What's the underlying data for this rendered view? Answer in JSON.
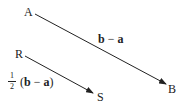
{
  "diagram": {
    "points": {
      "A": "A",
      "B": "B",
      "R": "R",
      "S": "S"
    },
    "vectors": [
      {
        "from": "A",
        "to": "B",
        "label_bold1": "b",
        "label_op": " − ",
        "label_bold2": "a"
      },
      {
        "from": "R",
        "to": "S",
        "fraction_num": "1",
        "fraction_den": "2",
        "label_open": "(",
        "label_bold1": "b",
        "label_op": " − ",
        "label_bold2": "a",
        "label_close": ")"
      }
    ],
    "colors": {
      "line": "#222222"
    }
  }
}
